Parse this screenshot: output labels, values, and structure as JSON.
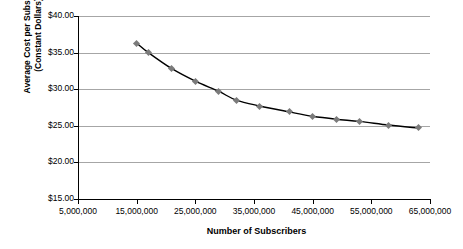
{
  "chart_data": {
    "type": "line",
    "title": "",
    "xlabel": "Number of Subscribers",
    "ylabel_line1": "Average Cost per Subscriber",
    "ylabel_line2": "(Constant Dollars)",
    "xlim": [
      5000000,
      65000000
    ],
    "ylim": [
      15,
      40
    ],
    "xticks": [
      5000000,
      15000000,
      25000000,
      35000000,
      45000000,
      55000000,
      65000000
    ],
    "xtick_labels": [
      "5,000,000",
      "15,000,000",
      "25,000,000",
      "35,000,000",
      "45,000,000",
      "55,000,000",
      "65,000,000"
    ],
    "yticks": [
      15,
      20,
      25,
      30,
      35,
      40
    ],
    "ytick_labels": [
      "$15.00",
      "$20.00",
      "$25.00",
      "$30.00",
      "$35.00",
      "$40.00"
    ],
    "grid": "horizontal",
    "legend": "none",
    "marker": "diamond",
    "marker_color": "#7b7b7b",
    "line_color": "#000000",
    "grid_color": "#a6a6a6",
    "x": [
      15000000,
      17000000,
      21000000,
      25000000,
      29000000,
      32000000,
      36000000,
      41000000,
      45000000,
      49000000,
      53000000,
      58000000,
      63000000
    ],
    "values": [
      36.3,
      35.0,
      32.8,
      31.1,
      29.7,
      28.5,
      27.7,
      26.9,
      26.3,
      25.9,
      25.6,
      25.1,
      24.7
    ],
    "series": [
      {
        "name": "Average Cost per Subscriber",
        "values": [
          36.3,
          35.0,
          32.8,
          31.1,
          29.7,
          28.5,
          27.7,
          26.9,
          26.3,
          25.9,
          25.6,
          25.1,
          24.7
        ]
      }
    ]
  }
}
